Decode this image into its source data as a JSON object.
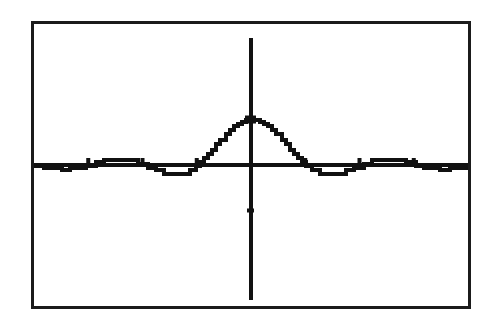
{
  "device": {
    "kind": "graphing-calculator-screen",
    "frame_color": "#1b1b1b",
    "background_color": "#ffffff",
    "ink_color": "#111111"
  },
  "chart_data": {
    "type": "line",
    "title": "",
    "subtitle": "",
    "xlabel": "",
    "ylabel": "",
    "legend": [],
    "legend_position": "none",
    "grid": false,
    "axes_visible": true,
    "xlim": [
      -12.566,
      12.566
    ],
    "ylim": [
      -3.1,
      3.1
    ],
    "x_tick_interval": 3.1416,
    "y_tick_interval": 1,
    "x_tick_values": [
      -9.4248,
      -6.2832,
      -3.1416,
      3.1416,
      6.2832,
      9.4248
    ],
    "y_tick_values": [
      -1
    ],
    "x_tick_labels": [
      "",
      "",
      "",
      "",
      "",
      ""
    ],
    "y_tick_labels": [
      ""
    ],
    "series": [
      {
        "name": "y1",
        "style": "solid",
        "color": "#111111",
        "x": [
          -12.566,
          -12.0,
          -11.5,
          -11.0,
          -10.5,
          -10.0,
          -9.5,
          -9.0,
          -8.5,
          -8.0,
          -7.5,
          -7.0,
          -6.5,
          -6.0,
          -5.5,
          -5.0,
          -4.5,
          -4.0,
          -3.5,
          -3.2,
          -3.0,
          -2.75,
          -2.5,
          -2.25,
          -2.0,
          -1.75,
          -1.5,
          -1.25,
          -1.0,
          -0.75,
          -0.5,
          -0.25,
          0.0,
          0.25,
          0.5,
          0.75,
          1.0,
          1.25,
          1.5,
          1.75,
          2.0,
          2.25,
          2.5,
          2.75,
          3.0,
          3.2,
          3.5,
          4.0,
          4.5,
          5.0,
          5.5,
          6.0,
          6.5,
          7.0,
          7.5,
          8.0,
          8.5,
          9.0,
          9.5,
          10.0,
          10.5,
          11.0,
          11.5,
          12.0,
          12.566
        ],
        "y": [
          0.0,
          -0.045,
          -0.087,
          -0.091,
          -0.085,
          -0.054,
          -0.008,
          0.046,
          0.094,
          0.124,
          0.125,
          0.094,
          0.035,
          -0.047,
          -0.128,
          -0.192,
          -0.217,
          -0.189,
          -0.1,
          -0.018,
          0.047,
          0.139,
          0.239,
          0.35,
          0.455,
          0.561,
          0.665,
          0.759,
          0.841,
          0.909,
          0.959,
          0.99,
          1.0,
          0.99,
          0.959,
          0.909,
          0.841,
          0.759,
          0.665,
          0.561,
          0.455,
          0.35,
          0.239,
          0.139,
          0.047,
          -0.018,
          -0.1,
          -0.189,
          -0.217,
          -0.192,
          -0.128,
          -0.047,
          0.035,
          0.094,
          0.125,
          0.124,
          0.094,
          0.046,
          -0.008,
          -0.054,
          -0.085,
          -0.091,
          -0.087,
          -0.045,
          0.0
        ],
        "description": "Even, symmetric damped-oscillation curve: a single tall central lobe peaking at the y-axis, flanked by shallow negative side lobes that return to the axis near the screen edges."
      }
    ],
    "annotations": [
      {
        "name": "peak",
        "x": 0,
        "y": 1.0,
        "label": ""
      },
      {
        "name": "left-negative-lobe",
        "x": -4.5,
        "y": -0.217,
        "label": ""
      },
      {
        "name": "right-negative-lobe",
        "x": 4.5,
        "y": -0.217,
        "label": ""
      }
    ]
  }
}
